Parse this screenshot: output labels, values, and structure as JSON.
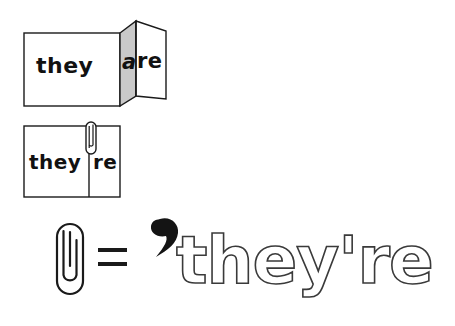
{
  "page": {
    "background_color": "#ffffff",
    "ink_color": "#1a1a1a",
    "panel_shade_color": "#c9c9c9",
    "outline_text_stroke_color": "#3a3a3a"
  },
  "figures": {
    "open_card": {
      "name": "folded card open showing they are",
      "front_word": "they",
      "fold_word_shaded": "a",
      "fold_word_white": "re"
    },
    "closed_card": {
      "name": "folded card closed showing theyre with paperclip",
      "left_word": "they",
      "right_word": "re",
      "clip_icon": "paperclip-icon"
    },
    "equation": {
      "left_icon": "paperclip-icon",
      "operator": "=",
      "right_icon": "apostrophe-icon",
      "result_text": "they're"
    }
  }
}
